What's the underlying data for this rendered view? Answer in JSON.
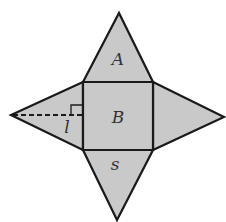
{
  "diagram": {
    "colors": {
      "fill": "#c9c9c9",
      "stroke": "#1a1a1a",
      "label": "#333333"
    },
    "labels": {
      "top_face": "A",
      "base": "B",
      "side_length": "s",
      "slant_height": "l"
    },
    "faces": [
      {
        "name": "base-square",
        "points": "83,82 153,82 153,150 83,150"
      },
      {
        "name": "top-triangle",
        "points": "83,82 119,13 153,82"
      },
      {
        "name": "right-triangle",
        "points": "153,82 224,117 153,150"
      },
      {
        "name": "bottom-triangle",
        "points": "83,150 117,220 153,150"
      },
      {
        "name": "left-triangle",
        "points": "83,82 11,115 83,150"
      }
    ]
  }
}
